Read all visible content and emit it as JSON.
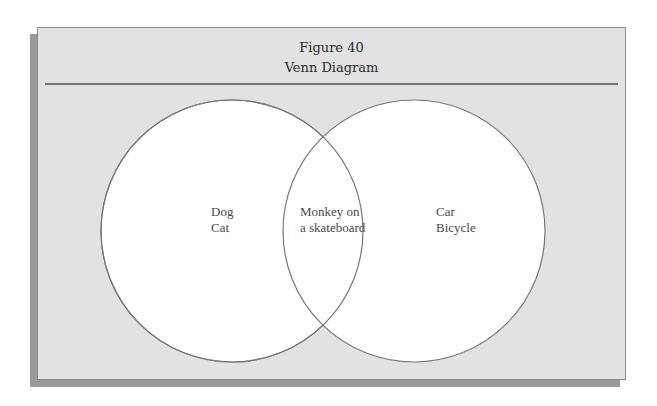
{
  "figure": {
    "number_label": "Figure 40",
    "title": "Venn Diagram"
  },
  "venn": {
    "sets": [
      {
        "name": "left",
        "items": [
          "Dog",
          "Cat"
        ]
      },
      {
        "name": "right",
        "items": [
          "Car",
          "Bicycle"
        ]
      }
    ],
    "intersection": {
      "items": [
        "Monkey on",
        "a skateboard"
      ]
    }
  },
  "colors": {
    "card_background": "#e2e2e2",
    "circle_fill": "#ffffff",
    "circle_stroke": "#777777",
    "text": "#4a4a4a"
  }
}
